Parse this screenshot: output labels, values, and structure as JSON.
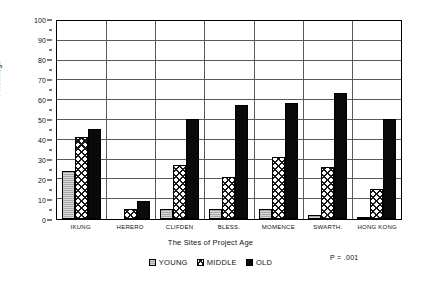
{
  "chart_data": {
    "type": "bar",
    "title": "",
    "xlabel": "The Sites of Project Age",
    "ylabel": "Percentage",
    "ylim": [
      0,
      100
    ],
    "ytick_step": 10,
    "yticks": [
      0,
      10,
      20,
      30,
      40,
      50,
      60,
      70,
      80,
      90,
      100
    ],
    "grid": true,
    "legend_position": "bottom-center",
    "categories": [
      "IKUNG",
      "HERERO",
      "CLIFDEN",
      "BLESS.",
      "MOMENCE",
      "SWARTH.",
      "HONG KONG"
    ],
    "series": [
      {
        "name": "YOUNG",
        "values": [
          24,
          0,
          5,
          5,
          5,
          2,
          1
        ]
      },
      {
        "name": "MIDDLE",
        "values": [
          41,
          5,
          27,
          21,
          31,
          26,
          15
        ]
      },
      {
        "name": "OLD",
        "values": [
          45,
          9,
          50,
          57,
          58,
          63,
          50
        ]
      }
    ],
    "annotation": "P = .001"
  },
  "axis": {
    "y_title": "Percentage",
    "x_title": "The Sites of Project Age",
    "ticks": [
      "100",
      "90",
      "80",
      "70",
      "60",
      "50",
      "40",
      "30",
      "20",
      "10",
      "0"
    ]
  },
  "legend": {
    "items": [
      {
        "label": "YOUNG",
        "swatch": "young-swatch-icon"
      },
      {
        "label": "MIDDLE",
        "swatch": "middle-swatch-icon"
      },
      {
        "label": "OLD",
        "swatch": "old-swatch-icon"
      }
    ]
  },
  "footnote": {
    "text": "P = .001"
  },
  "colors": {
    "young": "#a8a8a8",
    "middle": "#ffffff",
    "old": "#0a0a0a",
    "axis": "#000000",
    "grid": "#5a5a5a"
  }
}
